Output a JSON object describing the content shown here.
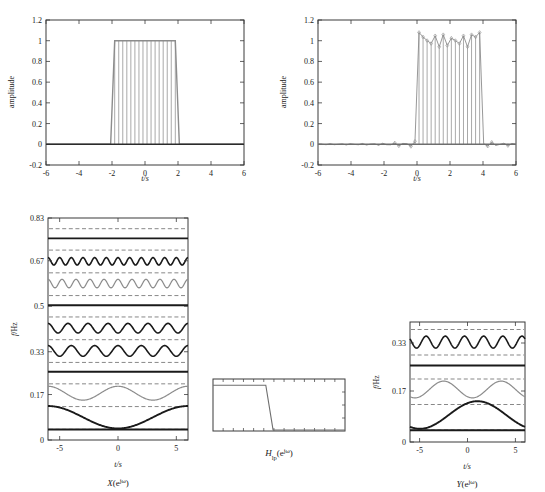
{
  "figure": {
    "panels": [
      "input-signal",
      "output-signal",
      "input-spectrum",
      "lowpass-filter",
      "output-spectrum"
    ]
  },
  "chart_data": [
    {
      "id": "top-left",
      "type": "line",
      "title": "",
      "xlabel": "t/s",
      "ylabel": "amplitude",
      "xlim": [
        -6,
        6
      ],
      "ylim": [
        -0.2,
        1.2
      ],
      "xticks": [
        -6,
        -4,
        -2,
        0,
        2,
        4,
        6
      ],
      "yticks": [
        -0.2,
        0,
        0.2,
        0.4,
        0.6,
        0.8,
        1,
        1.2
      ],
      "xticklabels": [
        "-6",
        "-4",
        "-2",
        "0",
        "2",
        "4",
        "6"
      ],
      "yticklabels": [
        "-0.2",
        "0",
        "0.2",
        "0.4",
        "0.6",
        "0.8",
        "1",
        "1.2"
      ],
      "grid": false,
      "series": [
        {
          "name": "rectangular-pulse-stems",
          "style": "stem",
          "color": "#8c8c8c",
          "description": "dense stem plot, value 1 for t in [-2,2], value 0 elsewhere",
          "pulse_start": -2.05,
          "pulse_end": 1.95,
          "pulse_height": 1.0,
          "baseline": 0.0,
          "n_stems": 49
        }
      ]
    },
    {
      "id": "top-right",
      "type": "line",
      "title": "",
      "xlabel": "t/s",
      "ylabel": "amplitude",
      "xlim": [
        -6,
        6
      ],
      "ylim": [
        -0.2,
        1.2
      ],
      "xticks": [
        -6,
        -4,
        -2,
        0,
        2,
        4,
        6
      ],
      "yticks": [
        -0.2,
        0,
        0.2,
        0.4,
        0.6,
        0.8,
        1,
        1.2
      ],
      "xticklabels": [
        "-6",
        "-4",
        "-2",
        "0",
        "2",
        "4",
        "6"
      ],
      "yticklabels": [
        "-0.2",
        "0",
        "0.2",
        "0.4",
        "0.6",
        "0.8",
        "1",
        "1.2"
      ],
      "grid": false,
      "series": [
        {
          "name": "filtered-pulse-stems",
          "style": "stem-marker",
          "color": "#8c8c8c",
          "description": "reconstructed pulse with Gibbs ringing, pulse region 0 to 4",
          "pulse_start": -0.1,
          "pulse_end": 3.9,
          "pulse_height": 1.0,
          "ripple_amplitude": 0.06,
          "overshoot": 1.08,
          "sidelobe_amplitude": 0.03,
          "n_stems": 49
        }
      ]
    },
    {
      "id": "bottom-left",
      "type": "line",
      "caption": "X(e^{j\\u03c9})",
      "xlabel": "t/s",
      "ylabel": "f/Hz",
      "xlim": [
        -6,
        6
      ],
      "ylim": [
        0,
        0.83
      ],
      "xticks": [
        -5,
        0,
        5
      ],
      "yticks": [
        0,
        0.17,
        0.33,
        0.5,
        0.67,
        0.83
      ],
      "xticklabels": [
        "-5",
        "0",
        "5"
      ],
      "yticklabels": [
        "0",
        "0.17",
        "0.33",
        "0.5",
        "0.67",
        "0.83"
      ],
      "grid": true,
      "grid_style": "dashed-horizontal",
      "gridlines": [
        0.04,
        0.125,
        0.21,
        0.29,
        0.375,
        0.46,
        0.54,
        0.625,
        0.71,
        0.79
      ],
      "series": [
        {
          "name": "freq-band-1",
          "offset": 0.035,
          "amp": 0.004,
          "cycles": 0.0,
          "color": "#1a1a1a",
          "weight": 1.9
        },
        {
          "name": "freq-band-2",
          "offset": 0.085,
          "amp": 0.042,
          "cycles": 1.0,
          "color": "#1a1a1a",
          "weight": 1.9
        },
        {
          "name": "freq-band-3",
          "offset": 0.175,
          "amp": 0.026,
          "cycles": 2.0,
          "color": "#8c8c8c",
          "weight": 1.2
        },
        {
          "name": "freq-band-4",
          "offset": 0.25,
          "amp": 0.005,
          "cycles": 0.0,
          "color": "#1a1a1a",
          "weight": 1.9
        },
        {
          "name": "freq-band-5",
          "offset": 0.333,
          "amp": 0.02,
          "cycles": 6.0,
          "color": "#1a1a1a",
          "weight": 1.6
        },
        {
          "name": "freq-band-6",
          "offset": 0.418,
          "amp": 0.018,
          "cycles": 7.0,
          "color": "#1a1a1a",
          "weight": 1.6
        },
        {
          "name": "freq-band-7",
          "offset": 0.5,
          "amp": 0.004,
          "cycles": 0.0,
          "color": "#1a1a1a",
          "weight": 1.9
        },
        {
          "name": "freq-band-8",
          "offset": 0.585,
          "amp": 0.016,
          "cycles": 10.0,
          "color": "#8c8c8c",
          "weight": 1.2
        },
        {
          "name": "freq-band-9",
          "offset": 0.668,
          "amp": 0.014,
          "cycles": 12.0,
          "color": "#1a1a1a",
          "weight": 1.6
        },
        {
          "name": "freq-band-10",
          "offset": 0.75,
          "amp": 0.004,
          "cycles": 0.0,
          "color": "#1a1a1a",
          "weight": 1.9
        }
      ]
    },
    {
      "id": "bottom-middle",
      "type": "line",
      "caption": "H_{lp}(e^{j\\u03c9})",
      "xlabel": "",
      "ylabel": "",
      "xlim": [
        0,
        1
      ],
      "ylim": [
        0,
        1
      ],
      "grid": false,
      "series": [
        {
          "name": "lowpass-magnitude",
          "color": "#6e6e6e",
          "description": "ideal lowpass: passband gain 1 until cutoff then drops to 0",
          "points": [
            [
              0.0,
              0.88
            ],
            [
              0.4,
              0.88
            ],
            [
              0.455,
              0.02
            ],
            [
              1.0,
              0.02
            ]
          ]
        }
      ]
    },
    {
      "id": "bottom-right",
      "type": "line",
      "caption": "Y(e^{j\\u03c9})",
      "xlabel": "t/s",
      "ylabel": "f/Hz",
      "xlim": [
        -6,
        6
      ],
      "ylim": [
        0,
        0.4
      ],
      "xticks": [
        -5,
        0,
        5
      ],
      "yticks": [
        0,
        0.17,
        0.33
      ],
      "xticklabels": [
        "-5",
        "0",
        "5"
      ],
      "yticklabels": [
        "0",
        "0.17",
        "0.33"
      ],
      "grid": true,
      "grid_style": "dashed-horizontal",
      "gridlines": [
        0.04,
        0.125,
        0.21,
        0.29,
        0.375
      ],
      "series": [
        {
          "name": "out-band-1",
          "offset": 0.035,
          "amp": 0.004,
          "cycles": 0.0,
          "color": "#1a1a1a",
          "weight": 1.9,
          "phase": 0.0
        },
        {
          "name": "out-band-2",
          "offset": 0.09,
          "amp": 0.046,
          "cycles": 1.0,
          "color": "#1a1a1a",
          "weight": 1.9,
          "phase": 2.6
        },
        {
          "name": "out-band-3",
          "offset": 0.175,
          "amp": 0.028,
          "cycles": 2.0,
          "color": "#8c8c8c",
          "weight": 1.2,
          "phase": 2.6
        },
        {
          "name": "out-band-4",
          "offset": 0.25,
          "amp": 0.005,
          "cycles": 0.0,
          "color": "#1a1a1a",
          "weight": 1.9,
          "phase": 0.0
        },
        {
          "name": "out-band-5",
          "offset": 0.333,
          "amp": 0.02,
          "cycles": 6.0,
          "color": "#1a1a1a",
          "weight": 1.6,
          "phase": 1.0
        }
      ]
    }
  ],
  "labels": {
    "amplitude": "amplitude",
    "t_s": "t/s",
    "f_hz": "f/Hz",
    "x_spectrum_base": "X(e",
    "y_spectrum_base": "Y(e",
    "h_filter_base": "H",
    "h_filter_sub": "lp",
    "h_filter_mid": "(e",
    "exp_sup": "jω",
    "paren_close": ")"
  },
  "ticks": {
    "top_x": [
      "-6",
      "-4",
      "-2",
      "0",
      "2",
      "4",
      "6"
    ],
    "top_y": [
      "1.2",
      "1",
      "0.8",
      "0.6",
      "0.4",
      "0.2",
      "0",
      "-0.2"
    ],
    "bl_y": [
      "0.83",
      "0.67",
      "0.5",
      "0.33",
      "0.17",
      "0"
    ],
    "br_y": [
      "0.33",
      "0.17",
      "0"
    ],
    "bot_x": [
      "-5",
      "0",
      "5"
    ]
  },
  "colors": {
    "stem_gray": "#8c8c8c",
    "trace_dark": "#1a1a1a",
    "trace_gray": "#8c8c8c",
    "grid_dash": "#555555",
    "axis": "#3a3a3a",
    "background": "#ffffff"
  }
}
